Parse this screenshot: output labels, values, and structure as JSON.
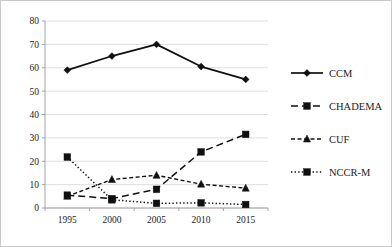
{
  "chart_data": {
    "type": "line",
    "title": "",
    "xlabel": "",
    "ylabel": "",
    "categories": [
      "1995",
      "2000",
      "2005",
      "2010",
      "2015"
    ],
    "x": [
      1995,
      2000,
      2005,
      2010,
      2015
    ],
    "ylim": [
      0,
      80
    ],
    "yticks": [
      0,
      10,
      20,
      30,
      40,
      50,
      60,
      70,
      80
    ],
    "grid": true,
    "legend_position": "right",
    "series": [
      {
        "name": "CCM",
        "values": [
          59,
          65,
          70,
          60.5,
          55
        ],
        "line_style": "solid",
        "marker": "diamond",
        "color": "#101010"
      },
      {
        "name": "CHADEMA",
        "values": [
          5.5,
          4,
          8,
          24,
          31.5
        ],
        "line_style": "dashed",
        "marker": "square",
        "color": "#101010"
      },
      {
        "name": "CUF",
        "values": [
          5,
          12.2,
          14,
          10.2,
          8.5
        ],
        "line_style": "dashed-small",
        "marker": "triangle",
        "color": "#101010"
      },
      {
        "name": "NCCR-M",
        "values": [
          21.8,
          3.5,
          2,
          2.2,
          1.5
        ],
        "line_style": "dotted",
        "marker": "square",
        "color": "#101010"
      }
    ]
  },
  "axes": {
    "ytick_labels": [
      "0",
      "10",
      "20",
      "30",
      "40",
      "50",
      "60",
      "70",
      "80"
    ],
    "xtick_labels": [
      "1995",
      "2000",
      "2005",
      "2010",
      "2015"
    ]
  },
  "legend": {
    "entries": [
      {
        "label": "CCM"
      },
      {
        "label": "CHADEMA"
      },
      {
        "label": "CUF"
      },
      {
        "label": "NCCR-M"
      }
    ]
  }
}
